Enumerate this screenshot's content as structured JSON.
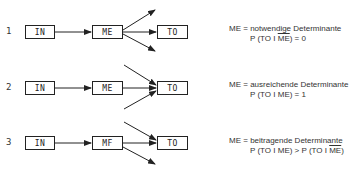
{
  "rows": [
    {
      "number": "1",
      "input": "IN",
      "mediator": "ME",
      "target": "TO",
      "definition_lhs": "ME =",
      "definition": "notwendige Determinante",
      "formula_prefix": "P (TO I ",
      "formula_overlined": "ME",
      "formula_suffix": ") = 0"
    },
    {
      "number": "2",
      "input": "IN",
      "mediator": "ME",
      "target": "TO",
      "definition_lhs": "ME =",
      "definition": "ausreichende Determinante",
      "formula": "P (TO I ME) = 1"
    },
    {
      "number": "3",
      "input": "IN",
      "mediator": "MF",
      "target": "TO",
      "definition_lhs": "ME =",
      "definition": "beitragende Determinante",
      "formula_prefix": "P (TO I ME) > P (TO I ",
      "formula_overlined": "ME",
      "formula_suffix": ")"
    }
  ],
  "colors": {
    "line": "#222222",
    "background": "#ffffff"
  }
}
